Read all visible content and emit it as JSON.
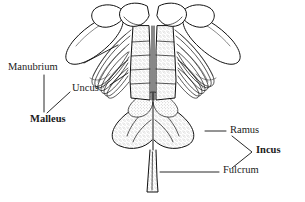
{
  "figure": {
    "background_color": "#ffffff",
    "ink_color": "#111111",
    "labels": [
      {
        "id": "manubrium",
        "text": "Manubrium",
        "bold": false,
        "x": 8,
        "y": 68,
        "leader": "diagonal-up-right"
      },
      {
        "id": "uncus",
        "text": "Uncus",
        "bold": false,
        "x": 72,
        "y": 89,
        "leader": "diagonal-up-right"
      },
      {
        "id": "malleus",
        "text": "Malleus",
        "bold": true,
        "x": 30,
        "y": 120,
        "leader": "converging-down"
      },
      {
        "id": "ramus",
        "text": "Ramus",
        "bold": false,
        "x": 231,
        "y": 131,
        "leader": "horizontal-left"
      },
      {
        "id": "incus",
        "text": "Incus",
        "bold": true,
        "x": 257,
        "y": 150,
        "leader": "bracket"
      },
      {
        "id": "fulcrum",
        "text": "Fulcrum",
        "bold": false,
        "x": 224,
        "y": 169,
        "leader": "horizontal-left"
      }
    ]
  }
}
